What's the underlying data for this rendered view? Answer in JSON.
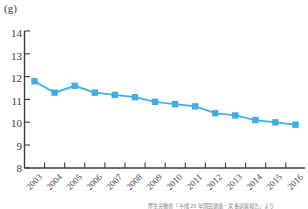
{
  "chart_data": {
    "type": "line",
    "title": "",
    "subtitle": "",
    "xlabel": "",
    "ylabel": "(g)",
    "unit": "(g)",
    "categories": [
      "2003",
      "2004",
      "2005",
      "2006",
      "2007",
      "2008",
      "2009",
      "2010",
      "2011",
      "2012",
      "2013",
      "2014",
      "2015",
      "2016"
    ],
    "values": [
      11.8,
      11.3,
      11.6,
      11.3,
      11.2,
      11.1,
      10.9,
      10.8,
      10.7,
      10.4,
      10.3,
      10.1,
      10.0,
      9.9
    ],
    "series": [
      {
        "name": "",
        "values": [
          11.8,
          11.3,
          11.6,
          11.3,
          11.2,
          11.1,
          10.9,
          10.8,
          10.7,
          10.4,
          10.3,
          10.1,
          10.0,
          9.9
        ]
      }
    ],
    "ylim": [
      8,
      14
    ],
    "yticks": [
      8,
      9,
      10,
      11,
      12,
      13,
      14
    ],
    "ytick_labels": [
      "8",
      "9",
      "10",
      "11",
      "12",
      "13",
      "14"
    ],
    "grid": false,
    "legend": "none",
    "marker": "square",
    "colors": {
      "line": "#43AFE4",
      "marker": "#3FAEE5",
      "axis": "#3c3c3c",
      "text": "#3a3a3a"
    }
  },
  "source_note": "厚生労働省「平成 29 年国民健康・栄養調査報告」より"
}
